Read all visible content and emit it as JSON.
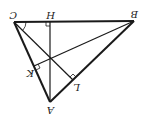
{
  "diagram": {
    "rotation_deg": 180,
    "line_color": "#1a1a1a",
    "points": {
      "A": {
        "label": "A",
        "x": 50,
        "y": 102
      },
      "B": {
        "label": "B",
        "x": 134,
        "y": 21
      },
      "C": {
        "label": "C",
        "x": 14,
        "y": 22
      },
      "H": {
        "label": "H",
        "x": 50,
        "y": 22
      },
      "K": {
        "label": "K",
        "x": 34,
        "y": 66
      },
      "L": {
        "label": "L",
        "x": 73,
        "y": 80
      }
    },
    "segments": [
      "CB",
      "CA",
      "AB",
      "AH",
      "BK",
      "CL"
    ],
    "right_angle_marks": [
      "H",
      "K",
      "L"
    ],
    "angle_marks": [
      "C"
    ]
  }
}
